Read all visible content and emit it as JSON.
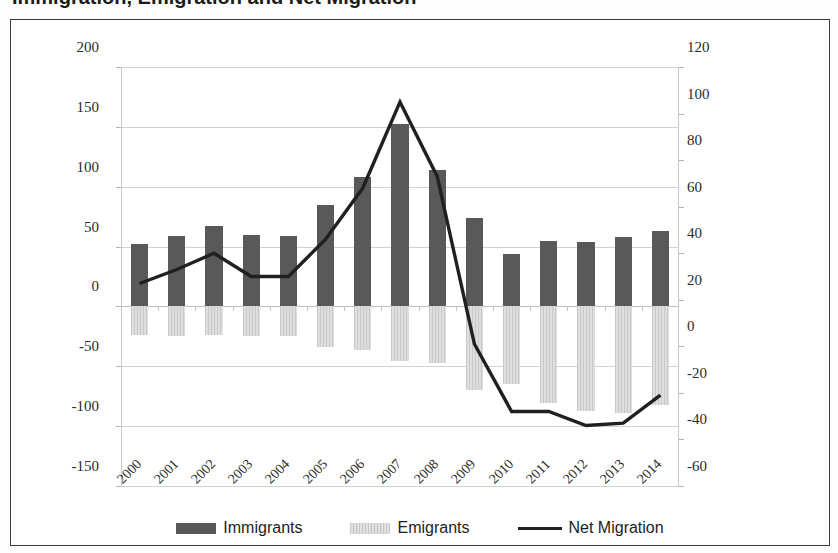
{
  "title": "Immigration, Emigration and Net Migration",
  "axes": {
    "left_ticks": [
      "200",
      "150",
      "100",
      "50",
      "0",
      "-50",
      "-100",
      "-150"
    ],
    "right_ticks": [
      "120",
      "100",
      "80",
      "60",
      "40",
      "20",
      "0",
      "-20",
      "-40",
      "-60"
    ]
  },
  "legend": {
    "immigrants": "Immigrants",
    "emigrants": "Emigrants",
    "net_migration": "Net Migration"
  },
  "colors": {
    "immigrants": "#595959",
    "emigrants": "#d4d4d4",
    "net_migration": "#202020",
    "gridline": "#d2d2d2",
    "frame": "#3a3a3a"
  },
  "chart_data": {
    "type": "bar",
    "title": "Immigration, Emigration and Net Migration",
    "xlabel": "",
    "ylabel": "",
    "categories": [
      "2000",
      "2001",
      "2002",
      "2003",
      "2004",
      "2005",
      "2006",
      "2007",
      "2008",
      "2009",
      "2010",
      "2011",
      "2012",
      "2013",
      "2014"
    ],
    "ylim": [
      -150,
      200
    ],
    "y2lim": [
      -60,
      120
    ],
    "grid": true,
    "legend_position": "bottom",
    "series": [
      {
        "name": "Immigrants",
        "type": "bar",
        "axis": "left",
        "values": [
          52,
          59,
          67,
          60,
          59,
          85,
          108,
          152,
          114,
          74,
          44,
          55,
          54,
          58,
          63
        ]
      },
      {
        "name": "Emigrants",
        "type": "bar",
        "axis": "left",
        "values": [
          -24,
          -25,
          -24,
          -25,
          -25,
          -34,
          -36,
          -46,
          -47,
          -70,
          -65,
          -81,
          -87,
          -89,
          -82
        ]
      },
      {
        "name": "Net Migration",
        "type": "line",
        "axis": "right",
        "values": [
          27,
          33,
          40,
          30,
          30,
          46,
          68,
          105,
          73,
          1,
          -28,
          -28,
          -34,
          -33,
          -21
        ]
      }
    ]
  }
}
